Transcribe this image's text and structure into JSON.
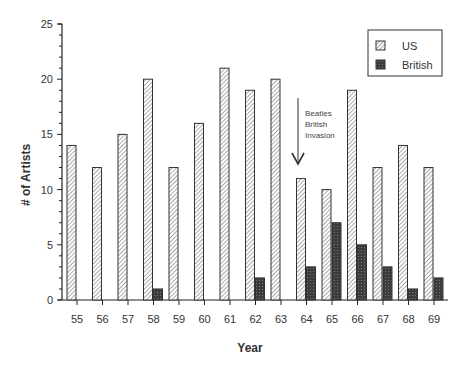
{
  "chart_data": {
    "type": "bar",
    "title": "",
    "xlabel": "Year",
    "ylabel": "# of Artists",
    "ylim": [
      0,
      25
    ],
    "yticks": [
      0,
      5,
      10,
      15,
      20,
      25
    ],
    "grid": false,
    "legend_position": "upper right",
    "categories": [
      "55",
      "56",
      "57",
      "58",
      "59",
      "60",
      "61",
      "62",
      "63",
      "64",
      "65",
      "66",
      "67",
      "68",
      "69"
    ],
    "series": [
      {
        "name": "US",
        "pattern": "diagonal-hatch",
        "values": [
          14,
          12,
          15,
          20,
          12,
          16,
          21,
          19,
          20,
          11,
          10,
          19,
          12,
          14,
          12
        ]
      },
      {
        "name": "British",
        "pattern": "dark-stipple",
        "values": [
          0,
          0,
          0,
          1,
          0,
          0,
          0,
          2,
          0,
          3,
          7,
          5,
          3,
          1,
          2
        ]
      }
    ],
    "annotations": [
      {
        "text": [
          "Beatles",
          "British",
          "Invasion"
        ],
        "arrow_to_category": "64"
      }
    ]
  },
  "legend": {
    "items": [
      {
        "label": "US"
      },
      {
        "label": "British"
      }
    ]
  },
  "colors": {
    "bar_outline": "#333333",
    "hatch": "#555555",
    "british_fill": "#4a4a4a",
    "axis": "#222222"
  }
}
